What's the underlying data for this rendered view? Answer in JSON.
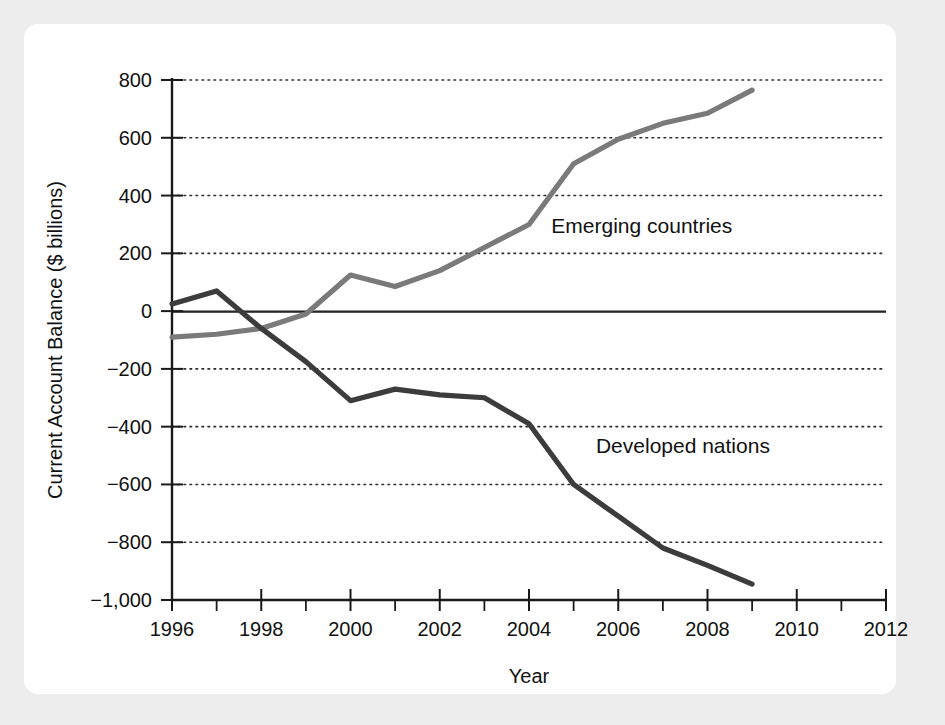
{
  "figure": {
    "background_color": "#ededed",
    "panel_color": "#ffffff"
  },
  "chart_data": {
    "type": "line",
    "title": "",
    "xlabel": "Year",
    "ylabel": "Current Account Balance ($ billions)",
    "xlim": [
      1996,
      2012
    ],
    "ylim": [
      -1000,
      800
    ],
    "xticks": [
      1996,
      1998,
      2000,
      2002,
      2004,
      2006,
      2008,
      2010,
      2012
    ],
    "xtick_labels": [
      "1996",
      "1998",
      "2000",
      "2002",
      "2004",
      "2006",
      "2008",
      "2010",
      "2012"
    ],
    "xminor_step": 1,
    "yticks": [
      -1000,
      -800,
      -600,
      -400,
      -200,
      0,
      200,
      400,
      600,
      800
    ],
    "ytick_labels": [
      "−1,000",
      "−800",
      "−600",
      "−400",
      "−200",
      "0",
      "200",
      "400",
      "600",
      "800"
    ],
    "grid": "horizontal-dotted",
    "zero_line": true,
    "legend": "inline-annotations",
    "x": [
      1996,
      1997,
      1998,
      1999,
      2000,
      2001,
      2002,
      2003,
      2004,
      2005,
      2006,
      2007,
      2008,
      2009
    ],
    "series": [
      {
        "name": "Emerging countries",
        "color": "#7a7a7a",
        "label_x": 2004.5,
        "label_y": 270,
        "values": [
          -90,
          -80,
          -60,
          -10,
          125,
          85,
          140,
          220,
          300,
          510,
          595,
          650,
          685,
          765
        ]
      },
      {
        "name": "Developed nations",
        "color": "#3c3c3c",
        "label_x": 2005.5,
        "label_y": -490,
        "values": [
          25,
          70,
          -60,
          -175,
          -310,
          -270,
          -290,
          -300,
          -390,
          -600,
          -710,
          -820,
          -880,
          -945
        ]
      }
    ]
  }
}
